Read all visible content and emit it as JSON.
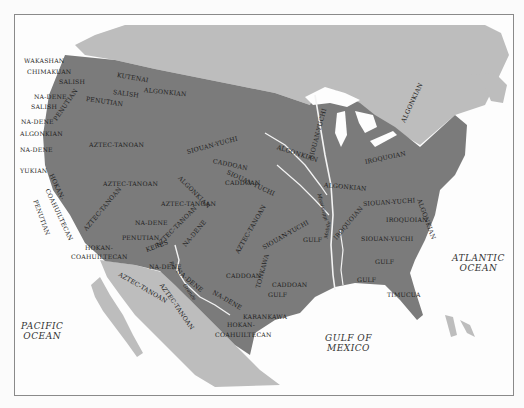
{
  "map": {
    "colors": {
      "water": "#fdfdfd",
      "foreign_land": "#bdbdbd",
      "us_land": "#7b7b7b",
      "rivers": "#f3f3f3",
      "label": "#1e1e1e",
      "border": "#8a8a8a"
    },
    "oceans": [
      {
        "id": "pacific",
        "line1": "PACIFIC",
        "line2": "OCEAN",
        "x": 6,
        "y": 306
      },
      {
        "id": "atlantic",
        "line1": "ATLANTIC",
        "line2": "OCEAN",
        "x": 437,
        "y": 238
      },
      {
        "id": "gulf",
        "line1": "GULF OF",
        "line2": "MEXICO",
        "x": 310,
        "y": 318
      }
    ],
    "rivers": [
      {
        "label": "Mississippi",
        "x": 318,
        "y": 190,
        "rot": 75
      },
      {
        "label": "Rio",
        "x": 170,
        "y": 258,
        "rot": 70
      },
      {
        "label": "Grande",
        "x": 183,
        "y": 281,
        "rot": 55
      },
      {
        "label": "Mobile",
        "x": 325,
        "y": 235,
        "rot": -80
      }
    ],
    "languages": [
      {
        "label": "WAKASHAN",
        "x": 23,
        "y": 57,
        "rot": 0
      },
      {
        "label": "CHIMAKUAN",
        "x": 26,
        "y": 68,
        "rot": 0
      },
      {
        "label": "SALISH",
        "x": 58,
        "y": 78,
        "rot": 0
      },
      {
        "label": "KUTENAI",
        "x": 116,
        "y": 71,
        "rot": 10
      },
      {
        "label": "SALISH",
        "x": 112,
        "y": 88,
        "rot": 8
      },
      {
        "label": "ALGONKIAN",
        "x": 143,
        "y": 86,
        "rot": 6
      },
      {
        "label": "NA-DENE",
        "x": 33,
        "y": 93,
        "rot": 0
      },
      {
        "label": "SALISH",
        "x": 30,
        "y": 103,
        "rot": 0
      },
      {
        "label": "PENUTIAN",
        "x": 85,
        "y": 95,
        "rot": 8
      },
      {
        "label": "PENUTIAN",
        "x": 54,
        "y": 116,
        "rot": -55
      },
      {
        "label": "NA-DENE",
        "x": 20,
        "y": 118,
        "rot": 0
      },
      {
        "label": "ALGONKIAN",
        "x": 19,
        "y": 130,
        "rot": 0
      },
      {
        "label": "NA-DENE",
        "x": 19,
        "y": 146,
        "rot": 0
      },
      {
        "label": "AZTEC-TANOAN",
        "x": 88,
        "y": 141,
        "rot": 0
      },
      {
        "label": "YUKIAN",
        "x": 19,
        "y": 167,
        "rot": 0
      },
      {
        "label": "HOKAN-",
        "x": 50,
        "y": 170,
        "rot": 65
      },
      {
        "label": "COAHUILTECAN",
        "x": 46,
        "y": 185,
        "rot": 65
      },
      {
        "label": "PENUTIAN",
        "x": 34,
        "y": 196,
        "rot": 70
      },
      {
        "label": "AZTEC-TANOAN",
        "x": 102,
        "y": 180,
        "rot": 0
      },
      {
        "label": "AZTEC-TANOAN",
        "x": 84,
        "y": 226,
        "rot": -50
      },
      {
        "label": "NA-DENE",
        "x": 134,
        "y": 219,
        "rot": 0
      },
      {
        "label": "PENUTIAN",
        "x": 121,
        "y": 234,
        "rot": 0
      },
      {
        "label": "HOKAN-",
        "x": 84,
        "y": 244,
        "rot": 0
      },
      {
        "label": "COAHUILTECAN",
        "x": 70,
        "y": 253,
        "rot": 0
      },
      {
        "label": "KERES",
        "x": 145,
        "y": 246,
        "rot": -20
      },
      {
        "label": "SIOUAN-YUCHI",
        "x": 186,
        "y": 148,
        "rot": -15
      },
      {
        "label": "CADDOAN",
        "x": 212,
        "y": 157,
        "rot": 12
      },
      {
        "label": "ALGONKIAN",
        "x": 276,
        "y": 143,
        "rot": 18
      },
      {
        "label": "SIOUAN-YUCHI",
        "x": 310,
        "y": 155,
        "rot": -75
      },
      {
        "label": "ALGONKIAN",
        "x": 402,
        "y": 118,
        "rot": -65
      },
      {
        "label": "SIOUAN-YUCHI",
        "x": 226,
        "y": 168,
        "rot": 25
      },
      {
        "label": "ALGONKIAN",
        "x": 178,
        "y": 173,
        "rot": 45
      },
      {
        "label": "CADDOAN",
        "x": 224,
        "y": 179,
        "rot": 0
      },
      {
        "label": "IROQUOIAN",
        "x": 364,
        "y": 158,
        "rot": -12
      },
      {
        "label": "ALGONKIAN",
        "x": 323,
        "y": 181,
        "rot": 5
      },
      {
        "label": "ALGONKIAN",
        "x": 418,
        "y": 195,
        "rot": 70
      },
      {
        "label": "SIOUAN-YUCHI",
        "x": 362,
        "y": 200,
        "rot": -4
      },
      {
        "label": "IROQUOIAN",
        "x": 385,
        "y": 216,
        "rot": 0
      },
      {
        "label": "IROQUOIAN",
        "x": 334,
        "y": 235,
        "rot": -50
      },
      {
        "label": "SIOUAN-YUCHI",
        "x": 360,
        "y": 235,
        "rot": 0
      },
      {
        "label": "AZTEC-TANOAN",
        "x": 160,
        "y": 200,
        "rot": 0
      },
      {
        "label": "AZTEC-TANOAN",
        "x": 156,
        "y": 242,
        "rot": -45
      },
      {
        "label": "NA-DENE",
        "x": 183,
        "y": 242,
        "rot": -50
      },
      {
        "label": "AZTEC-TANOAN",
        "x": 236,
        "y": 249,
        "rot": -60
      },
      {
        "label": "SIOUAN-YUCHI",
        "x": 262,
        "y": 244,
        "rot": -30
      },
      {
        "label": "GULF",
        "x": 302,
        "y": 236,
        "rot": 0
      },
      {
        "label": "GULF",
        "x": 374,
        "y": 258,
        "rot": 0
      },
      {
        "label": "GULF",
        "x": 356,
        "y": 276,
        "rot": 0
      },
      {
        "label": "NA-DENE",
        "x": 148,
        "y": 263,
        "rot": 0
      },
      {
        "label": "AZTEC-TANOAN",
        "x": 118,
        "y": 270,
        "rot": 30
      },
      {
        "label": "NA-DENE",
        "x": 176,
        "y": 266,
        "rot": 40
      },
      {
        "label": "CADDOAN",
        "x": 225,
        "y": 272,
        "rot": 0
      },
      {
        "label": "TONKAWA",
        "x": 257,
        "y": 284,
        "rot": -75
      },
      {
        "label": "CADDOAN",
        "x": 271,
        "y": 281,
        "rot": 0
      },
      {
        "label": "GULF",
        "x": 267,
        "y": 291,
        "rot": 0
      },
      {
        "label": "NA-DENE",
        "x": 212,
        "y": 288,
        "rot": 30
      },
      {
        "label": "AZTEC-TANOAN",
        "x": 160,
        "y": 280,
        "rot": 55
      },
      {
        "label": "KARANKAWA",
        "x": 242,
        "y": 313,
        "rot": 0
      },
      {
        "label": "HOKAN-",
        "x": 226,
        "y": 321,
        "rot": 0
      },
      {
        "label": "COAHUILTECAN",
        "x": 214,
        "y": 331,
        "rot": 0
      },
      {
        "label": "TIMUCUA",
        "x": 386,
        "y": 291,
        "rot": 0
      }
    ]
  }
}
